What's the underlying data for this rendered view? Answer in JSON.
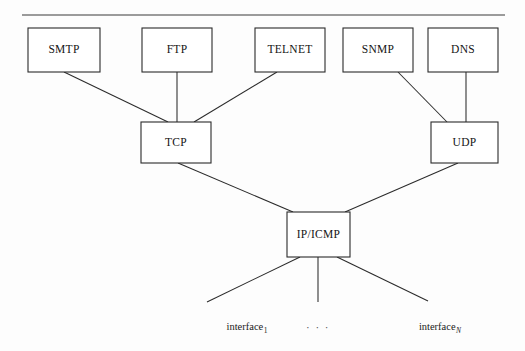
{
  "diagram": {
    "type": "layered-network-protocol-diagram",
    "background_color": "#fdfdfd",
    "line_color": "#2b2b2b",
    "box_fill_color": "#ffffff",
    "top_rule": {
      "name": "top-horizontal-rule",
      "x1": 22,
      "y1": 15,
      "x2": 505,
      "y2": 15
    },
    "application_layer": {
      "label": "Application protocols",
      "boxes": [
        {
          "label": "SMTP",
          "x": 28,
          "y": 28,
          "w": 72,
          "h": 44
        },
        {
          "label": "FTP",
          "x": 142,
          "y": 28,
          "w": 70,
          "h": 44
        },
        {
          "label": "TELNET",
          "x": 255,
          "y": 28,
          "w": 70,
          "h": 44
        },
        {
          "label": "SNMP",
          "x": 343,
          "y": 28,
          "w": 70,
          "h": 44
        },
        {
          "label": "DNS",
          "x": 428,
          "y": 28,
          "w": 70,
          "h": 44
        }
      ]
    },
    "transport_layer": {
      "label": "Transport protocols",
      "boxes": [
        {
          "label": "TCP",
          "x": 141,
          "y": 122,
          "w": 70,
          "h": 41
        },
        {
          "label": "UDP",
          "x": 431,
          "y": 122,
          "w": 67,
          "h": 41
        }
      ]
    },
    "network_layer": {
      "label": "Network protocol",
      "boxes": [
        {
          "label": "IP/ICMP",
          "x": 287,
          "y": 212,
          "w": 63,
          "h": 45
        }
      ]
    },
    "link_layer": {
      "label": "Interfaces",
      "leaves": [
        {
          "base": "interface",
          "subscript": "1",
          "subscript_italic": false,
          "x": 247,
          "y": 330
        },
        {
          "base": "interface",
          "subscript": "N",
          "subscript_italic": true,
          "x": 440,
          "y": 330
        }
      ],
      "ellipsis": {
        "label": "· · ·",
        "x": 318,
        "y": 331
      }
    },
    "connectors": [
      {
        "from": "SMTP",
        "to": "TCP",
        "x1": 64,
        "y1": 72,
        "x2": 168,
        "y2": 122
      },
      {
        "from": "FTP",
        "to": "TCP",
        "x1": 177,
        "y1": 72,
        "x2": 177,
        "y2": 122
      },
      {
        "from": "TELNET",
        "to": "TCP",
        "x1": 277,
        "y1": 72,
        "x2": 194,
        "y2": 122
      },
      {
        "from": "SNMP",
        "to": "UDP",
        "x1": 398,
        "y1": 72,
        "x2": 447,
        "y2": 122
      },
      {
        "from": "DNS",
        "to": "UDP",
        "x1": 466,
        "y1": 72,
        "x2": 466,
        "y2": 122
      },
      {
        "from": "TCP",
        "to": "IP/ICMP",
        "x1": 178,
        "y1": 163,
        "x2": 293,
        "y2": 212
      },
      {
        "from": "UDP",
        "to": "IP/ICMP",
        "x1": 458,
        "y1": 163,
        "x2": 345,
        "y2": 212
      },
      {
        "from": "IP/ICMP",
        "to": "interface-1",
        "x1": 300,
        "y1": 257,
        "x2": 207,
        "y2": 302
      },
      {
        "from": "IP/ICMP",
        "to": "interface-mid",
        "x1": 318,
        "y1": 257,
        "x2": 318,
        "y2": 302
      },
      {
        "from": "IP/ICMP",
        "to": "interface-N",
        "x1": 337,
        "y1": 257,
        "x2": 428,
        "y2": 301
      }
    ]
  }
}
